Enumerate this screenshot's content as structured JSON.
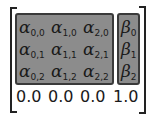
{
  "matrix": {
    "alpha_symbol": "α",
    "beta_symbol": "β",
    "alpha": [
      [
        {
          "sub": "0,0"
        },
        {
          "sub": "1,0"
        },
        {
          "sub": "2,0"
        }
      ],
      [
        {
          "sub": "0,1"
        },
        {
          "sub": "1,1"
        },
        {
          "sub": "2,1"
        }
      ],
      [
        {
          "sub": "0,2"
        },
        {
          "sub": "1,2"
        },
        {
          "sub": "2,2"
        }
      ]
    ],
    "beta": [
      {
        "sub": "0"
      },
      {
        "sub": "1"
      },
      {
        "sub": "2"
      }
    ],
    "bottom_row": [
      "0.0",
      "0.0",
      "0.0",
      "1.0"
    ],
    "colors": {
      "box_fill": "#8c8c8c",
      "box_border": "#3a3a3a",
      "text": "#1a1a1a",
      "bracket": "#222222"
    }
  }
}
